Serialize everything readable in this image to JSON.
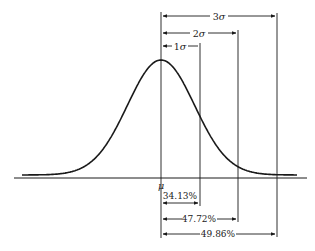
{
  "figure": {
    "mean_label": "μ",
    "sigma_labels": [
      {
        "id": "1sigma",
        "text": "1σ",
        "num": "1",
        "sym": "σ"
      },
      {
        "id": "2sigma",
        "text": "2σ",
        "num": "2",
        "sym": "σ"
      },
      {
        "id": "3sigma",
        "text": "3σ",
        "num": "3",
        "sym": "σ"
      }
    ],
    "percent_labels": [
      {
        "id": "p1",
        "text": "34.13%"
      },
      {
        "id": "p2",
        "text": "47.72%"
      },
      {
        "id": "p3",
        "text": "49.86%"
      }
    ],
    "colors": {
      "line": "#1a1a1a",
      "background": "#ffffff"
    }
  },
  "layout": {
    "mu_x": 161,
    "sigma_px": 39,
    "baseline_y": 178,
    "peak_y": 60,
    "tail_y": 175,
    "axis_x": [
      14,
      307
    ],
    "curve_x": [
      22,
      297
    ],
    "top_brackets_y": [
      46,
      33,
      16
    ],
    "bottom_brackets_y": [
      203,
      219,
      234
    ]
  }
}
